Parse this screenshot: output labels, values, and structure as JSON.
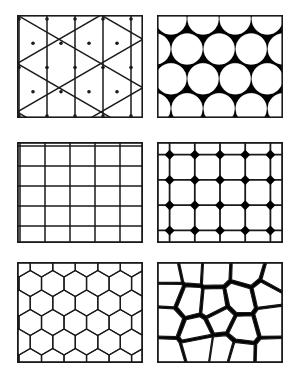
{
  "figure": {
    "background_color": "#ffffff",
    "ink_color": "#1a1a1a",
    "fill_black": "#000000",
    "fill_white": "#ffffff",
    "width": 296,
    "height": 375,
    "columns": 2,
    "rows": 3,
    "panel_count": 6
  },
  "panels": [
    {
      "id": "panel-1",
      "position": "top-left",
      "pattern_name": "triangular-lattice",
      "description": "Triangular lattice of vertical lines crossed by two diagonal line families with dots at vertices",
      "x": 17,
      "y": 15,
      "width": 126,
      "height": 103,
      "border_width": 1.6,
      "line_color": "#1a1a1a",
      "fill_color": "#ffffff",
      "line_width": 1.5,
      "vertical_spacing": 28,
      "diagonal_angle_deg": 60,
      "vertex_dots": true,
      "dot_radius": 1.8
    },
    {
      "id": "panel-2",
      "position": "top-right",
      "pattern_name": "close-packed-circles",
      "description": "Close packed white circles on solid black background in staggered hexagonal rows",
      "x": 157,
      "y": 15,
      "width": 126,
      "height": 103,
      "border_width": 1.6,
      "line_color": "#1a1a1a",
      "background_fill": "#000000",
      "circle_fill": "#ffffff",
      "circle_radius": 15.5,
      "columns": 4,
      "rows": 4,
      "stagger": true,
      "row_offset": 16
    },
    {
      "id": "panel-3",
      "position": "middle-left",
      "pattern_name": "square-grid",
      "description": "Plain orthogonal square grid of horizontal and vertical lines",
      "x": 17,
      "y": 142,
      "width": 126,
      "height": 101,
      "border_width": 1.8,
      "line_color": "#1a1a1a",
      "fill_color": "#ffffff",
      "line_width": 1.5,
      "columns": 5,
      "rows": 4,
      "cell_width": 25,
      "cell_height": 20
    },
    {
      "id": "panel-4",
      "position": "middle-right",
      "pattern_name": "square-grid-with-diamonds",
      "description": "Square grid with solid black diamonds centred on every line intersection",
      "x": 157,
      "y": 142,
      "width": 126,
      "height": 101,
      "border_width": 1.8,
      "line_color": "#1a1a1a",
      "fill_color": "#ffffff",
      "diamond_fill": "#000000",
      "line_width": 1.8,
      "columns": 5,
      "rows": 4,
      "diamond_half_size": 5.0,
      "diamond_count": 20
    },
    {
      "id": "panel-5",
      "position": "bottom-left",
      "pattern_name": "honeycomb-hexagonal",
      "description": "Honeycomb lattice of flat-topped regular hexagons in staggered rows",
      "x": 17,
      "y": 262,
      "width": 126,
      "height": 101,
      "border_width": 1.8,
      "line_color": "#1a1a1a",
      "fill_color": "#ffffff",
      "line_width": 1.3,
      "hex_radius": 13,
      "columns": 5,
      "rows": 5,
      "orientation": "flat-top"
    },
    {
      "id": "panel-6",
      "position": "bottom-right",
      "pattern_name": "irregular-pentagon-tiling",
      "description": "Irregular pentagonal tiling with solid black rhombic gaps between white cells",
      "x": 157,
      "y": 262,
      "width": 126,
      "height": 101,
      "border_width": 1.8,
      "line_color": "#1a1a1a",
      "background_fill": "#000000",
      "cell_fill": "#ffffff",
      "line_width": 1.2,
      "cell_count": 20,
      "black_rhombi_count": 9
    }
  ]
}
